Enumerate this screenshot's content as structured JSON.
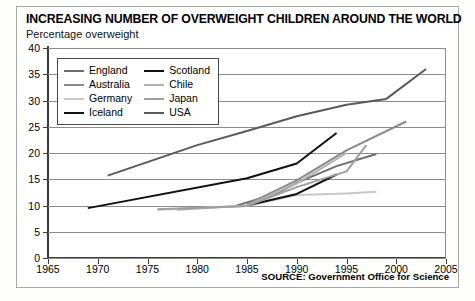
{
  "chart_data": {
    "type": "line",
    "title": "INCREASING NUMBER OF OVERWEIGHT CHILDREN AROUND THE WORLD",
    "subtitle": "Percentage overweight",
    "ylabel": "Percentage overweight",
    "xlabel": "",
    "xlim": [
      1965,
      2005
    ],
    "ylim": [
      0,
      40
    ],
    "xticks": [
      1965,
      1970,
      1975,
      1980,
      1985,
      1990,
      1995,
      2000,
      2005
    ],
    "yticks": [
      0,
      5,
      10,
      15,
      20,
      25,
      30,
      35,
      40
    ],
    "grid": "horizontal",
    "legend_position": "upper-left-inside",
    "source": "SOURCE: Government Office for Science",
    "series": [
      {
        "name": "England",
        "color": "#6e6e6e",
        "width": 2.0,
        "points": [
          [
            1984,
            10.0
          ],
          [
            1988,
            12.3
          ],
          [
            1990,
            14.3
          ],
          [
            1994,
            17.5
          ],
          [
            1998,
            19.8
          ]
        ]
      },
      {
        "name": "Australia",
        "color": "#8a8a8a",
        "width": 2.0,
        "points": [
          [
            1985,
            10.2
          ],
          [
            1990,
            14.8
          ],
          [
            1995,
            20.5
          ],
          [
            2001,
            26.0
          ]
        ]
      },
      {
        "name": "Germany",
        "color": "#c8c8c8",
        "width": 2.0,
        "points": [
          [
            1976,
            9.2
          ],
          [
            1985,
            9.9
          ],
          [
            1990,
            12.0
          ],
          [
            1995,
            12.3
          ],
          [
            1998,
            12.6
          ]
        ]
      },
      {
        "name": "Iceland",
        "color": "#111111",
        "width": 2.0,
        "points": [
          [
            1969,
            9.5
          ],
          [
            1985,
            15.2
          ],
          [
            1990,
            18.0
          ],
          [
            1994,
            23.8
          ]
        ]
      },
      {
        "name": "Scotland",
        "color": "#111111",
        "width": 2.0,
        "points": [
          [
            1985,
            10.0
          ],
          [
            1990,
            12.2
          ],
          [
            1994,
            15.9
          ]
        ]
      },
      {
        "name": "Chile",
        "color": "#b0b0b0",
        "width": 2.0,
        "points": [
          [
            1978,
            9.2
          ],
          [
            1985,
            10.0
          ],
          [
            1990,
            14.2
          ],
          [
            1995,
            20.0
          ]
        ]
      },
      {
        "name": "Japan",
        "color": "#9e9e9e",
        "width": 2.0,
        "points": [
          [
            1976,
            9.3
          ],
          [
            1985,
            9.9
          ],
          [
            1990,
            13.5
          ],
          [
            1995,
            16.5
          ],
          [
            1997,
            21.5
          ]
        ]
      },
      {
        "name": "USA",
        "color": "#5a5a5a",
        "width": 2.0,
        "points": [
          [
            1971,
            15.7
          ],
          [
            1980,
            21.5
          ],
          [
            1985,
            24.2
          ],
          [
            1990,
            27.0
          ],
          [
            1995,
            29.2
          ],
          [
            1999,
            30.3
          ],
          [
            2003,
            36.0
          ]
        ]
      }
    ],
    "legend": [
      {
        "name": "England",
        "color": "#6e6e6e",
        "width": 2.0
      },
      {
        "name": "Scotland",
        "color": "#111111",
        "width": 2.2
      },
      {
        "name": "Australia",
        "color": "#8a8a8a",
        "width": 2.0
      },
      {
        "name": "Chile",
        "color": "#b0b0b0",
        "width": 2.0
      },
      {
        "name": "Germany",
        "color": "#c8c8c8",
        "width": 2.0
      },
      {
        "name": "Japan",
        "color": "#9e9e9e",
        "width": 2.0
      },
      {
        "name": "Iceland",
        "color": "#111111",
        "width": 2.4
      },
      {
        "name": "USA",
        "color": "#5a5a5a",
        "width": 2.2
      }
    ]
  }
}
